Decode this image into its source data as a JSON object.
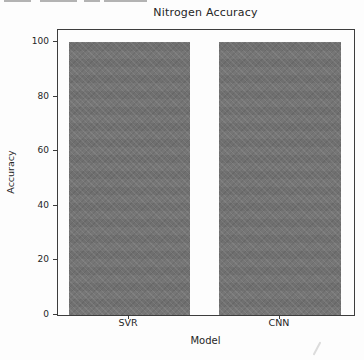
{
  "chart_data": {
    "type": "bar",
    "title": "Nitrogen Accuracy",
    "xlabel": "Model",
    "ylabel": "Accuracy",
    "categories": [
      "SVR",
      "CNN"
    ],
    "values": [
      100,
      100
    ],
    "yticks": [
      0,
      20,
      40,
      60,
      80,
      100
    ],
    "ylim": [
      0,
      104.5
    ],
    "grid": false,
    "legend": null,
    "bar_color": "#737373",
    "spine_color": "#3d3d3d",
    "text_color": "#262626",
    "background_color": "#fdfdfd"
  },
  "artifacts": {
    "top_cropped_text_dashes": [
      {
        "left": 4,
        "width": 27
      },
      {
        "left": 40,
        "width": 37
      },
      {
        "left": 84,
        "width": 16
      },
      {
        "left": 104,
        "width": 43
      }
    ],
    "bottom_right_smudge": true
  }
}
